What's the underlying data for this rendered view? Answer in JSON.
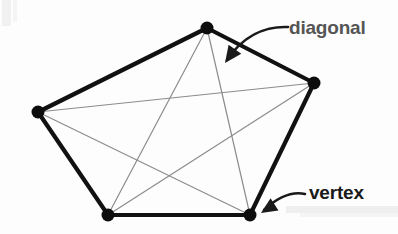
{
  "figure": {
    "background_color": "#fdfdfd",
    "edge_color": "#111111",
    "diagonal_color": "#8c8c8c",
    "vertex_color": "#0d0d0d",
    "edge_width": 4.2,
    "diagonal_width": 1.2,
    "vertex_radius": 6.5,
    "shape_name": "pentagon",
    "vertex_count": 5,
    "diagonal_count": 5,
    "vertices": [
      {
        "name": "top",
        "x": 207,
        "y": 28
      },
      {
        "name": "right",
        "x": 314,
        "y": 83
      },
      {
        "name": "bottom-right",
        "x": 250,
        "y": 215
      },
      {
        "name": "bottom-left",
        "x": 108,
        "y": 215
      },
      {
        "name": "left",
        "x": 38,
        "y": 112
      }
    ],
    "edges": [
      {
        "from": 0,
        "to": 1
      },
      {
        "from": 1,
        "to": 2
      },
      {
        "from": 2,
        "to": 3
      },
      {
        "from": 3,
        "to": 4
      },
      {
        "from": 4,
        "to": 0
      }
    ],
    "diagonals": [
      {
        "from": 0,
        "to": 2
      },
      {
        "from": 0,
        "to": 3
      },
      {
        "from": 1,
        "to": 3
      },
      {
        "from": 1,
        "to": 4
      },
      {
        "from": 2,
        "to": 4
      }
    ]
  },
  "annotations": {
    "diagonal": {
      "label": "diagonal",
      "color": "#555555",
      "text_x": 289,
      "text_y": 17,
      "arrow_path": "M 288 27 C 265 26, 243 36, 227 60",
      "arrow_tip": {
        "x": 225,
        "y": 63
      },
      "arrow_color": "#1a1a1a"
    },
    "vertex": {
      "label": "vertex",
      "color": "#1a1a1a",
      "text_x": 309,
      "text_y": 182,
      "arrow_path": "M 305 194 C 291 191, 277 198, 264 210",
      "arrow_tip": {
        "x": 261,
        "y": 213
      },
      "arrow_color": "#1a1a1a"
    }
  },
  "artifacts": {
    "left_stripe_color": "#f0f0f0",
    "bottom_band_color": "#eeeeee"
  }
}
